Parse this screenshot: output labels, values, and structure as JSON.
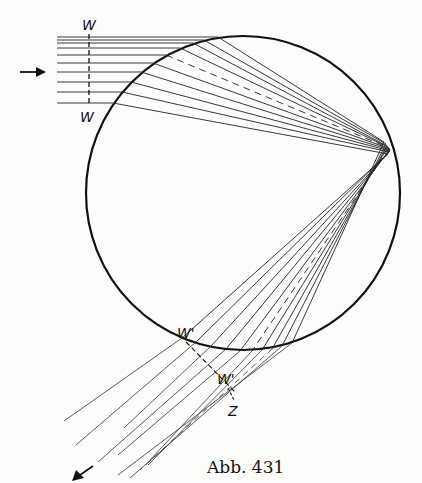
{
  "figure": {
    "caption": "Abb. 431",
    "labels": {
      "wavefront_in_top": "W",
      "wavefront_in_bottom": "W",
      "wavefront_out_1": "W'",
      "wavefront_out_2": "W'",
      "caustic_point": "Z"
    },
    "circle": {
      "cx": 243,
      "cy": 193,
      "r": 158
    },
    "incoming_rays_y": [
      37,
      40,
      43,
      48,
      55,
      63,
      72,
      82,
      92,
      103
    ],
    "incoming_ray_start_x": 57,
    "dashed_ray_index": 4,
    "colors": {
      "ink": "#111111",
      "paper": "#fdfdfb"
    }
  }
}
